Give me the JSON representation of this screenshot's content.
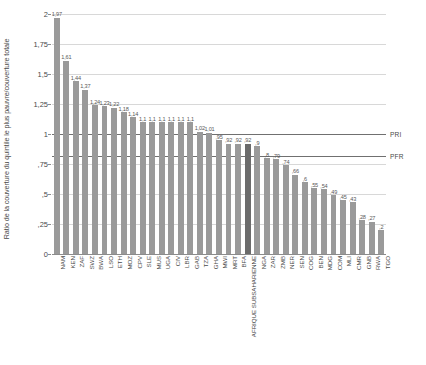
{
  "chart_data": {
    "type": "bar",
    "title": "",
    "subtitle": "",
    "xlabel": "",
    "ylabel": "Ratio de la couverture du quintile le plus pauvre/couverture totale",
    "ylim": [
      0,
      2
    ],
    "ytick_labels": [
      "2",
      "1,75",
      "1,5",
      "1,25",
      "1",
      ",75",
      ",5",
      ",25",
      "0"
    ],
    "ytick_values": [
      2,
      1.75,
      1.5,
      1.25,
      1,
      0.75,
      0.5,
      0.25,
      0
    ],
    "grid": true,
    "legend_position": "none",
    "decimal_separator": ",",
    "highlight_color": "#6b6b6b",
    "bar_color": "#9a9a9a",
    "categories": [
      "NAM",
      "KEN",
      "ZAF",
      "SWZ",
      "BWA",
      "LSO",
      "ETH",
      "MOZ",
      "CPV",
      "SLE",
      "MUS",
      "UGA",
      "CIV",
      "LBR",
      "GAB",
      "TZA",
      "GHA",
      "MWI",
      "MRT",
      "BFA",
      "AFRIQUE SUBSAHARIENNE",
      "NGA",
      "ZAR",
      "ZMB",
      "NER",
      "SEN",
      "COG",
      "BEN",
      "MDG",
      "COM",
      "MLI",
      "CMR",
      "GNB",
      "RWA",
      "TGO"
    ],
    "values": [
      1.97,
      1.61,
      1.44,
      1.37,
      1.24,
      1.23,
      1.22,
      1.18,
      1.14,
      1.1,
      1.1,
      1.1,
      1.1,
      1.1,
      1.1,
      1.02,
      1.01,
      0.95,
      0.92,
      0.92,
      0.92,
      0.9,
      0.8,
      0.79,
      0.74,
      0.66,
      0.6,
      0.55,
      0.54,
      0.49,
      0.45,
      0.43,
      0.28,
      0.27,
      0.2
    ],
    "value_labels": [
      "1,97",
      "1,61",
      "1,44",
      "1,37",
      "1,24",
      "1,23",
      "1,22",
      "1,18",
      "1,14",
      "1,1",
      "1,1",
      "1,1",
      "1,1",
      "1,1",
      "1,1",
      "1,02",
      "1,01",
      ",95",
      ",92",
      ",92",
      ",92",
      ",9",
      ",8",
      ",79",
      ",74",
      ",66",
      ",6",
      ",55",
      ",54",
      ",49",
      ",45",
      ",43",
      ",28",
      ",27",
      ",2"
    ],
    "highlighted_category": "AFRIQUE SUBSAHARIENNE",
    "reference_lines": [
      {
        "label": "PRI",
        "value": 1.0
      },
      {
        "label": "PFR",
        "value": 0.82
      }
    ]
  }
}
